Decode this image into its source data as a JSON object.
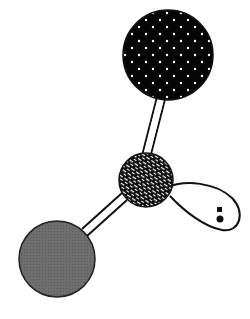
{
  "diagram": {
    "type": "molecular-model",
    "colors": {
      "background": "#ffffff",
      "outline": "#111111",
      "top_atom_fill": "#050505",
      "top_atom_dots": "#ffffff",
      "center_atom_fill": "#111111",
      "center_atom_pattern": "#ffffff",
      "left_atom_fill": "#6e6e6e",
      "lone_pair_dots": "#111111"
    },
    "atoms": [
      {
        "id": "top",
        "pattern": "dotted-black",
        "cx": 168,
        "cy": 55,
        "r": 45
      },
      {
        "id": "center",
        "pattern": "crosshatch",
        "cx": 146,
        "cy": 180,
        "r": 27
      },
      {
        "id": "bottom-left",
        "pattern": "solid-gray",
        "cx": 57,
        "cy": 259,
        "r": 38
      }
    ],
    "bonds": [
      {
        "from": "center",
        "to": "top"
      },
      {
        "from": "center",
        "to": "bottom-left"
      }
    ],
    "lone_pairs": [
      {
        "id": "lone-pair-1",
        "direction": "right-down",
        "electrons": 2
      }
    ]
  }
}
